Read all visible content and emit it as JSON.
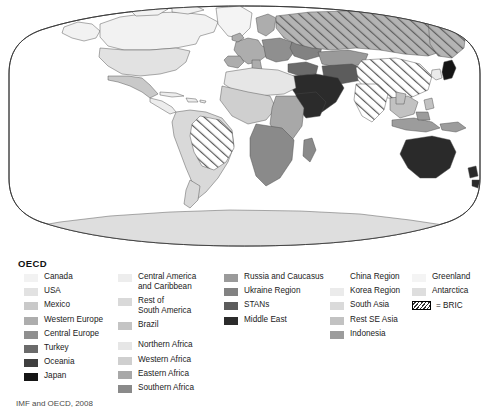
{
  "figure": {
    "map_type": "world-choropleth-robinson",
    "ocean_color": "#ffffff",
    "border_color": "#333333",
    "bric_hatch_color": "#555555"
  },
  "legend": {
    "title": "OECD",
    "columns": [
      {
        "id": "col-oecd",
        "items": [
          {
            "label": "Canada",
            "color": "#f2f2f2"
          },
          {
            "label": "USA",
            "color": "#e2e2e2"
          },
          {
            "label": "Mexico",
            "color": "#c9c9c9"
          },
          {
            "label": "Western Europe",
            "color": "#adadad"
          },
          {
            "label": "Central Europe",
            "color": "#8f8f8f"
          },
          {
            "label": "Turkey",
            "color": "#6b6b6b"
          },
          {
            "label": "Oceania",
            "color": "#3f3f3f"
          },
          {
            "label": "Japan",
            "color": "#151515"
          }
        ]
      },
      {
        "id": "col-americas-africa",
        "items": [
          {
            "label": "Central America\nand Caribbean",
            "color": "#ededed",
            "tall": true
          },
          {
            "label": "Rest  of\nSouth America",
            "color": "#d9d9d9",
            "tall": true
          },
          {
            "label": "Brazil",
            "color": "#c4c4c4"
          },
          {
            "label": "Northern Africa",
            "color": "#e6e6e6",
            "gap": true
          },
          {
            "label": "Western Africa",
            "color": "#cfcfcf"
          },
          {
            "label": "Eastern Africa",
            "color": "#a8a8a8"
          },
          {
            "label": "Southern Africa",
            "color": "#8a8a8a"
          }
        ]
      },
      {
        "id": "col-eurasia",
        "items": [
          {
            "label": "Russia and Caucasus",
            "color": "#9a9a9a"
          },
          {
            "label": "Ukraine Region",
            "color": "#828282"
          },
          {
            "label": "STANs",
            "color": "#5c5c5c"
          },
          {
            "label": "Middle East",
            "color": "#2b2b2b"
          }
        ]
      },
      {
        "id": "col-asia",
        "items": [
          {
            "label": "China Region",
            "color": "#ffffff"
          },
          {
            "label": "Korea Region",
            "color": "#ebebeb"
          },
          {
            "label": "South Asia",
            "color": "#dadada"
          },
          {
            "label": "Rest SE Asia",
            "color": "#c2c2c2"
          },
          {
            "label": "Indonesia",
            "color": "#9c9c9c"
          }
        ]
      },
      {
        "id": "col-polar",
        "items": [
          {
            "label": "Greenland",
            "color": "#f4f4f4"
          },
          {
            "label": "Antarctica",
            "color": "#dedede"
          }
        ]
      }
    ],
    "bric_key": {
      "label": "= BRIC",
      "pattern": "diagonal-hatch"
    }
  },
  "source": {
    "caption": "IMF and OECD, 2008"
  }
}
